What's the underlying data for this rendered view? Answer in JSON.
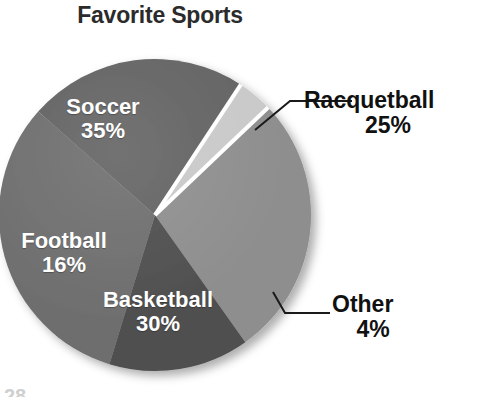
{
  "chart_data": {
    "type": "pie",
    "title": "Favorite Sports",
    "xlabel": "",
    "ylabel": "",
    "legend_position": "none",
    "grid": false,
    "categories": [
      "Soccer",
      "Racquetball",
      "Other",
      "Basketball",
      "Football"
    ],
    "values": [
      35,
      25,
      4,
      30,
      16
    ],
    "value_unit": "%",
    "slices": [
      {
        "label": "Soccer",
        "value": 35,
        "percent_text": "35%",
        "color": "#6e6e6e",
        "label_placement": "inside",
        "label_color": "#ffffff",
        "start_angle_deg": 197,
        "end_angle_deg": 323
      },
      {
        "label": "Racquetball",
        "value": 25,
        "percent_text": "25%",
        "color": "#636363",
        "label_placement": "outside",
        "label_color": "#111111",
        "leader_line": true,
        "start_angle_deg": 323,
        "end_angle_deg": 53
      },
      {
        "label": "Other",
        "value": 4,
        "percent_text": "4%",
        "color": "#c9c9c9",
        "label_placement": "outside",
        "label_color": "#111111",
        "leader_line": true,
        "start_angle_deg": 53,
        "end_angle_deg": 67
      },
      {
        "label": "Basketball",
        "value": 30,
        "percent_text": "30%",
        "color": "#8e8e8e",
        "label_placement": "inside",
        "label_color": "#ffffff",
        "start_angle_deg": 67,
        "end_angle_deg": 175
      },
      {
        "label": "Football",
        "value": 16,
        "percent_text": "16%",
        "color": "#4f4f4f",
        "label_placement": "inside",
        "label_color": "#ffffff",
        "start_angle_deg": 175,
        "end_angle_deg": 197
      }
    ],
    "total": 110,
    "background_color": "#ffffff",
    "separator_color": "#ffffff",
    "has_drop_shadow": true
  },
  "title": {
    "text": "Favorite Sports"
  },
  "labels": {
    "soccer": {
      "name": "Soccer",
      "pct": "35%"
    },
    "football": {
      "name": "Football",
      "pct": "16%"
    },
    "basketball": {
      "name": "Basketball",
      "pct": "30%"
    },
    "racquetball": {
      "name": "Racquetball",
      "pct": "25%"
    },
    "other": {
      "name": "Other",
      "pct": "4%"
    }
  },
  "page_footer": {
    "partial_text": "28"
  },
  "colors": {
    "soccer": "#6e6e6e",
    "racquetball": "#636363",
    "other": "#c9c9c9",
    "basketball": "#8e8e8e",
    "football": "#4f4f4f",
    "title": "#2b2b2b",
    "inside_label": "#ffffff",
    "outside_label": "#111111",
    "background": "#ffffff"
  }
}
